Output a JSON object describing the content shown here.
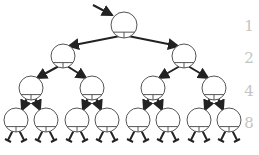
{
  "diagram": {
    "type": "binary-tree",
    "levels": [
      {
        "level": 1,
        "count_label": "1",
        "nodes": 1
      },
      {
        "level": 2,
        "count_label": "2",
        "nodes": 2
      },
      {
        "level": 3,
        "count_label": "4",
        "nodes": 4
      },
      {
        "level": 4,
        "count_label": "8",
        "nodes": 8
      }
    ],
    "colors": {
      "stroke": "#222222",
      "node_stroke": "#555555",
      "label": "#c4c4c4"
    }
  }
}
